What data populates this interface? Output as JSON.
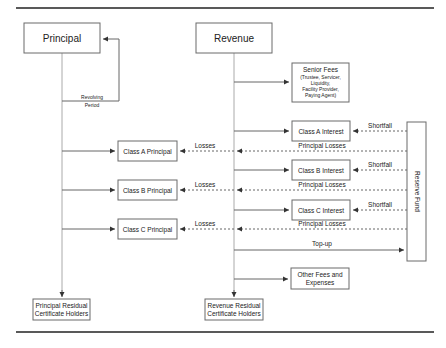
{
  "nodes": {
    "principal": "Principal",
    "revenue": "Revenue",
    "senior_fees": {
      "title": "Senior Fees",
      "lines": [
        "(Trustee, Servicer,",
        "Liquidity,",
        "Facility Provider,",
        "Paying Agent)"
      ]
    },
    "class_a_interest": "Class A Interest",
    "class_b_interest": "Class B Interest",
    "class_c_interest": "Class C Interest",
    "class_a_principal": "Class A Principal",
    "class_b_principal": "Class B Principal",
    "class_c_principal": "Class C Principal",
    "reserve_fund": "Reserve Fund",
    "other_fees": [
      "Other Fees and",
      "Expenses"
    ],
    "principal_residual": [
      "Principal Residual",
      "Certificate Holders"
    ],
    "revenue_residual": [
      "Revenue Residual",
      "Certificate Holders"
    ]
  },
  "edge_labels": {
    "revolving": [
      "Revolving",
      "Period"
    ],
    "shortfall": "Shortfall",
    "principal_losses": "Principal Losses",
    "losses": "Losses",
    "top_up": "Top-up"
  }
}
